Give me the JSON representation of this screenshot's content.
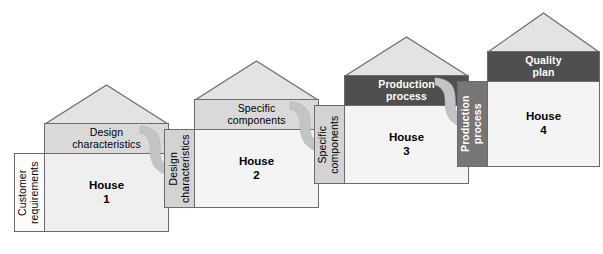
{
  "diagram": {
    "colors": {
      "roof_fill": "#e3e3e3",
      "header_light": "#d9d9d9",
      "header_dark": "#4f4f4f",
      "side_white": "#fdfdfd",
      "side_light": "#d3d3d3",
      "side_dark": "#767676",
      "body_fill": "#f1f1f1",
      "outline": "#6b6b6b",
      "arrow_fill": "#c4c4c4",
      "background": "#ffffff"
    },
    "houses": [
      {
        "id": "house-1",
        "body_label": "House\n1",
        "body_label_line1": "House",
        "body_label_line2": "1",
        "header_label_line1": "Design",
        "header_label_line2": "characteristics",
        "header_style": "light",
        "side_label_line1": "Customer",
        "side_label_line2": "requirements",
        "side_style": "white"
      },
      {
        "id": "house-2",
        "body_label_line1": "House",
        "body_label_line2": "2",
        "header_label_line1": "Specific",
        "header_label_line2": "components",
        "header_style": "light",
        "side_label_line1": "Design",
        "side_label_line2": "characteristics",
        "side_style": "light"
      },
      {
        "id": "house-3",
        "body_label_line1": "House",
        "body_label_line2": "3",
        "header_label_line1": "Production",
        "header_label_line2": "process",
        "header_style": "dark",
        "side_label_line1": "Specific",
        "side_label_line2": "components",
        "side_style": "light"
      },
      {
        "id": "house-4",
        "body_label_line1": "House",
        "body_label_line2": "4",
        "header_label_line1": "Quality",
        "header_label_line2": "plan",
        "header_style": "dark",
        "side_label_line1": "Production",
        "side_label_line2": "process",
        "side_style": "dark"
      }
    ],
    "connectors": [
      {
        "id": "arrow-1",
        "from": "house-1",
        "to": "house-2",
        "shape": "s-curve-down-right"
      },
      {
        "id": "arrow-2",
        "from": "house-2",
        "to": "house-3",
        "shape": "s-curve-down-right"
      },
      {
        "id": "arrow-3",
        "from": "house-3",
        "to": "house-4",
        "shape": "s-curve-down-right"
      }
    ]
  }
}
